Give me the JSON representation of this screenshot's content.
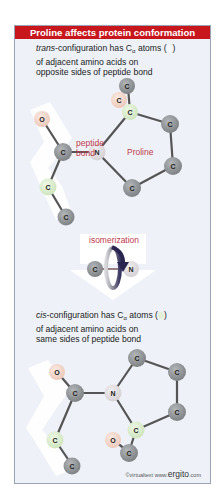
{
  "title": "Proline affects protein conformation",
  "trans": {
    "caption_prefix": "trans",
    "caption_line1_rest": "-configuration has C",
    "caption_sub": "α",
    "caption_line1_end": " atoms (",
    "caption_line1_close": ")",
    "caption_line2": "of adjacent amino acids on",
    "caption_line3": "opposite sides of peptide bond",
    "label_peptide": "peptide",
    "label_bond": "bond",
    "label_proline": "Proline"
  },
  "isomerization": {
    "label": "isomerization",
    "atom_left": "C",
    "atom_right": "N"
  },
  "cis": {
    "caption_prefix": "cis",
    "caption_line1_rest": "-configuration has C",
    "caption_sub": "α",
    "caption_line1_end": " atoms (",
    "caption_line1_close": ")",
    "caption_line2": "of adjacent amino acids on",
    "caption_line3": "same sides of peptide bond"
  },
  "atoms": {
    "C": "C",
    "N": "N",
    "O": "O"
  },
  "credit": {
    "prefix": "©virtualtext  www.",
    "brand": "ergito",
    "suffix": ".com"
  },
  "colors": {
    "title_bg": "#c8161d",
    "panel_bg": "#eef2f8",
    "carbon": "#8e9193",
    "alpha_carbon": "#d7ecc8",
    "oxygen": "#f2d4c8",
    "nitrogen": "#e2dde0",
    "label_red": "#c0394a",
    "arrow_dark": "#2a2550"
  }
}
